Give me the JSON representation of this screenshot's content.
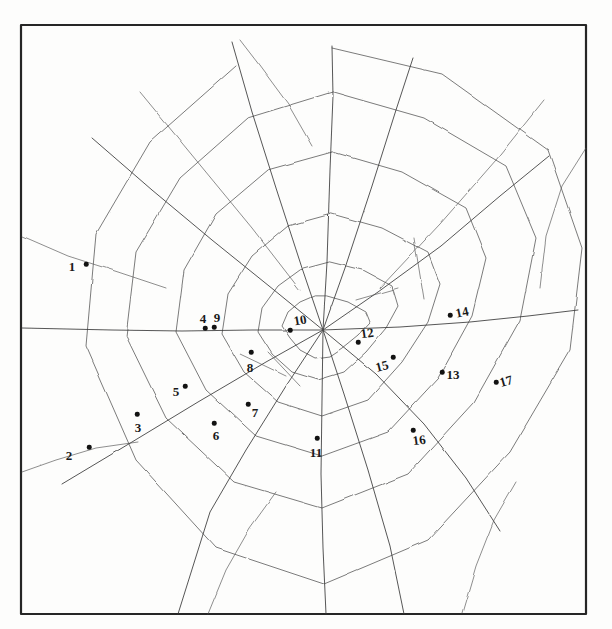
{
  "figure": {
    "background_color": "#fdfdfc",
    "ink_color": "#2b2b2b",
    "dot_color": "#121212",
    "frame": {
      "name": "border-rectangle",
      "x": 21,
      "y": 25,
      "width": 565,
      "height": 589,
      "stroke": "#262626",
      "stroke_width": 2.2
    },
    "hub": {
      "x": 323,
      "y": 330
    }
  },
  "points": [
    {
      "id": 1,
      "label": "1",
      "label_x": 72,
      "label_y": 266,
      "dot_x": 86,
      "dot_y": 264,
      "rotate": 0
    },
    {
      "id": 2,
      "label": "2",
      "label_x": 69,
      "label_y": 455,
      "dot_x": 89,
      "dot_y": 447,
      "rotate": 0
    },
    {
      "id": 3,
      "label": "3",
      "label_x": 138,
      "label_y": 427,
      "dot_x": 137,
      "dot_y": 414,
      "rotate": 0
    },
    {
      "id": 4,
      "label": "4",
      "label_x": 203,
      "label_y": 318,
      "dot_x": 205,
      "dot_y": 328,
      "rotate": 0
    },
    {
      "id": 5,
      "label": "5",
      "label_x": 176,
      "label_y": 391,
      "dot_x": 185,
      "dot_y": 386,
      "rotate": 0
    },
    {
      "id": 6,
      "label": "6",
      "label_x": 216,
      "label_y": 435,
      "dot_x": 214,
      "dot_y": 423,
      "rotate": 0
    },
    {
      "id": 7,
      "label": "7",
      "label_x": 255,
      "label_y": 412,
      "dot_x": 248,
      "dot_y": 404,
      "rotate": 0
    },
    {
      "id": 8,
      "label": "8",
      "label_x": 250,
      "label_y": 367,
      "dot_x": 251,
      "dot_y": 352,
      "rotate": 0
    },
    {
      "id": 9,
      "label": "9",
      "label_x": 217,
      "label_y": 317,
      "dot_x": 214,
      "dot_y": 327,
      "rotate": 0
    },
    {
      "id": 10,
      "label": "10",
      "label_x": 300,
      "label_y": 320,
      "dot_x": 290,
      "dot_y": 330,
      "rotate": -10
    },
    {
      "id": 11,
      "label": "11",
      "label_x": 316,
      "label_y": 452,
      "dot_x": 317,
      "dot_y": 438,
      "rotate": 0
    },
    {
      "id": 12,
      "label": "12",
      "label_x": 367,
      "label_y": 333,
      "dot_x": 358,
      "dot_y": 342,
      "rotate": -8
    },
    {
      "id": 13,
      "label": "13",
      "label_x": 453,
      "label_y": 374,
      "dot_x": 442,
      "dot_y": 372,
      "rotate": 0
    },
    {
      "id": 14,
      "label": "14",
      "label_x": 462,
      "label_y": 312,
      "dot_x": 450,
      "dot_y": 315,
      "rotate": -12
    },
    {
      "id": 15,
      "label": "15",
      "label_x": 382,
      "label_y": 366,
      "dot_x": 393,
      "dot_y": 357,
      "rotate": -14
    },
    {
      "id": 16,
      "label": "16",
      "label_x": 419,
      "label_y": 440,
      "dot_x": 413,
      "dot_y": 430,
      "rotate": -8
    },
    {
      "id": 17,
      "label": "17",
      "label_x": 506,
      "label_y": 381,
      "dot_x": 496,
      "dot_y": 382,
      "rotate": -16
    }
  ],
  "web": {
    "radials": [
      {
        "name": "radial-up",
        "path": "M 323 330 L 327 262 L 330 170 L 333 96 L 332 46"
      },
      {
        "name": "radial-up-slight-r",
        "path": "M 323 330 L 345 268 L 372 186 L 396 110 L 413 58"
      },
      {
        "name": "radial-upper-right",
        "path": "M 323 330 L 378 292 L 441 246 L 500 196 L 549 156"
      },
      {
        "name": "radial-right",
        "path": "M 323 330 L 400 327 L 470 322 L 528 316 L 578 310"
      },
      {
        "name": "radial-lower-right",
        "path": "M 323 330 L 376 374 L 424 424 L 466 478 L 500 531"
      },
      {
        "name": "radial-down-right",
        "path": "M 323 330 L 344 394 L 368 470 L 390 546 L 404 614"
      },
      {
        "name": "radial-down",
        "path": "M 323 330 L 322 400 L 321 474 L 323 548 L 326 614"
      },
      {
        "name": "radial-down-left",
        "path": "M 323 330 L 286 386 L 246 450 L 210 512 L 178 614"
      },
      {
        "name": "radial-lower-left",
        "path": "M 323 330 L 266 362 L 198 402 L 132 442 L 62 484"
      },
      {
        "name": "radial-left",
        "path": "M 323 330 L 252 330 L 182 331 L 112 330 L 22 328"
      },
      {
        "name": "radial-upper-left",
        "path": "M 323 330 L 274 290 L 212 240 L 152 190 L 92 138"
      },
      {
        "name": "radial-up-slight-l",
        "path": "M 323 330 L 302 268 L 276 188 L 252 112 L 232 42"
      }
    ],
    "spirals": [
      {
        "name": "spiral-ring-1",
        "path": "M 327 296 L 348 302 L 366 312 L 370 322 L 358 335 L 342 348 L 330 356 L 315 358 L 300 350 L 290 338 L 282 326 L 288 312 L 300 302 L 314 296 Z"
      },
      {
        "name": "spiral-ring-2",
        "path": "M 330 262 L 362 270 L 392 286 L 398 306 L 386 328 L 366 352 L 344 372 L 318 380 L 292 372 L 272 354 L 258 332 L 262 308 L 278 286 L 300 270 Z"
      },
      {
        "name": "spiral-ring-3",
        "path": "M 332 214 L 382 228 L 428 252 L 440 284 L 428 322 L 402 362 L 368 400 L 322 416 L 278 402 L 244 372 L 222 334 L 228 294 L 252 256 L 288 226 Z"
      },
      {
        "name": "spiral-ring-4",
        "path": "M 333 152 L 402 172 L 466 208 L 486 258 L 472 316 L 438 378 L 388 432 L 322 456 L 256 436 L 206 390 L 176 332 L 184 270 L 216 214 L 268 170 Z"
      },
      {
        "name": "spiral-ring-5",
        "path": "M 333 92 L 424 118 L 506 166 L 536 238 L 520 320 L 474 402 L 408 474 L 322 508 L 234 482 L 166 418 L 126 336 L 136 252 L 180 178 L 248 118 Z"
      },
      {
        "name": "spiral-ring-6",
        "path": "M 332 48 L 442 74 L 548 150 L 582 248 L 570 350 L 510 452 L 428 540 L 324 584 L 216 548 L 136 460 L 86 346 L 96 234 L 150 142 L 236 66"
      }
    ],
    "stray_strands": [
      {
        "name": "stray-top-left",
        "path": "M 240 40 L 260 66 L 288 104 L 312 146"
      },
      {
        "name": "stray-left-edge",
        "path": "M 22 236 L 68 256 L 118 272 L 166 288"
      },
      {
        "name": "stray-lower-left",
        "path": "M 22 472 L 56 460 L 96 448 L 138 442"
      },
      {
        "name": "stray-right-edge",
        "path": "M 586 148 L 562 186 L 546 236 L 540 288"
      },
      {
        "name": "stray-bottom",
        "path": "M 208 614 L 226 570 L 250 528 L 276 492"
      },
      {
        "name": "stray-bottom-right",
        "path": "M 462 614 L 476 566 L 494 520 L 516 482"
      },
      {
        "name": "stray-cross-1",
        "path": "M 140 92 L 196 160 L 252 228 L 300 290"
      },
      {
        "name": "stray-cross-2",
        "path": "M 544 100 L 496 160 L 440 224 L 380 288"
      },
      {
        "name": "stray-short-a",
        "path": "M 240 354 L 286 376"
      },
      {
        "name": "stray-short-b",
        "path": "M 268 352 L 300 386"
      },
      {
        "name": "stray-short-c",
        "path": "M 356 300 L 398 288"
      },
      {
        "name": "stray-short-d",
        "path": "M 414 238 L 424 300"
      }
    ]
  }
}
